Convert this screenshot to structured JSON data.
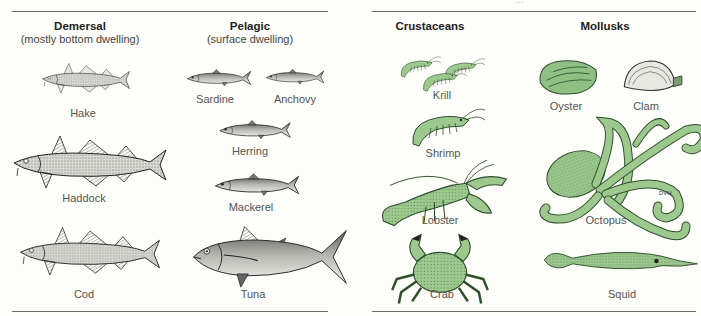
{
  "figure": {
    "top_caption_clipped": "…",
    "colors": {
      "line_art": "#2a2a2a",
      "fish_fill": "#e9e9e4",
      "fish_shade": "#9a9a96",
      "shellfish_green": "#9dc98f",
      "shellfish_dark": "#3f6e3a",
      "rule": "#6b6b6b",
      "background": "#fdfdf9"
    },
    "finfish": {
      "demersal": {
        "title": "Demersal",
        "subtitle": "(mostly bottom dwelling)",
        "items": [
          {
            "name": "Hake",
            "icon": "hake-fish-icon"
          },
          {
            "name": "Haddock",
            "icon": "haddock-fish-icon"
          },
          {
            "name": "Cod",
            "icon": "cod-fish-icon"
          }
        ]
      },
      "pelagic": {
        "title": "Pelagic",
        "subtitle": "(surface dwelling)",
        "items": [
          {
            "name": "Sardine",
            "icon": "sardine-fish-icon"
          },
          {
            "name": "Anchovy",
            "icon": "anchovy-fish-icon"
          },
          {
            "name": "Herring",
            "icon": "herring-fish-icon"
          },
          {
            "name": "Mackerel",
            "icon": "mackerel-fish-icon"
          },
          {
            "name": "Tuna",
            "icon": "tuna-fish-icon"
          }
        ]
      }
    },
    "shellfish": {
      "crustaceans": {
        "title": "Crustaceans",
        "items": [
          {
            "name": "Krill",
            "icon": "krill-icon"
          },
          {
            "name": "Shrimp",
            "icon": "shrimp-icon"
          },
          {
            "name": "Lobster",
            "icon": "lobster-icon"
          },
          {
            "name": "Crab",
            "icon": "crab-icon"
          }
        ]
      },
      "mollusks": {
        "title": "Mollusks",
        "items": [
          {
            "name": "Oyster",
            "icon": "oyster-icon"
          },
          {
            "name": "Clam",
            "icon": "clam-icon"
          },
          {
            "name": "Octopus",
            "icon": "octopus-icon"
          },
          {
            "name": "Squid",
            "icon": "squid-icon"
          }
        ]
      }
    },
    "artist_signature": "DVH"
  }
}
